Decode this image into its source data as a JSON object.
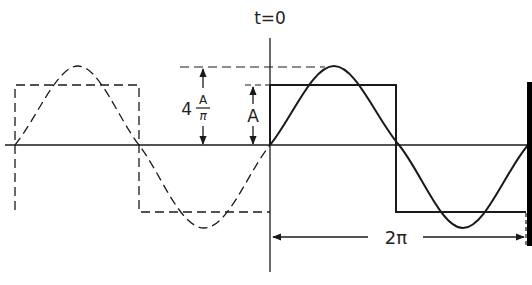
{
  "diagram": {
    "labels": {
      "time_origin": "t=0",
      "square_amplitude": "A",
      "sine_amplitude_coef": "4",
      "sine_amplitude_num": "A",
      "sine_amplitude_den": "π",
      "period": "2π"
    },
    "colors": {
      "line": "#1a1a1a",
      "background": "#ffffff",
      "edge_band": "#000000"
    },
    "elements": [
      "horizontal time axis",
      "vertical axis at t=0",
      "solid square wave (amplitude A) for t>=0",
      "solid fundamental sine (amplitude 4A/π) for t>=0",
      "dashed square wave for t<0",
      "dashed fundamental sine for t<0",
      "dimension arrows for A and 4A/π",
      "period dimension arrow 2π"
    ]
  }
}
